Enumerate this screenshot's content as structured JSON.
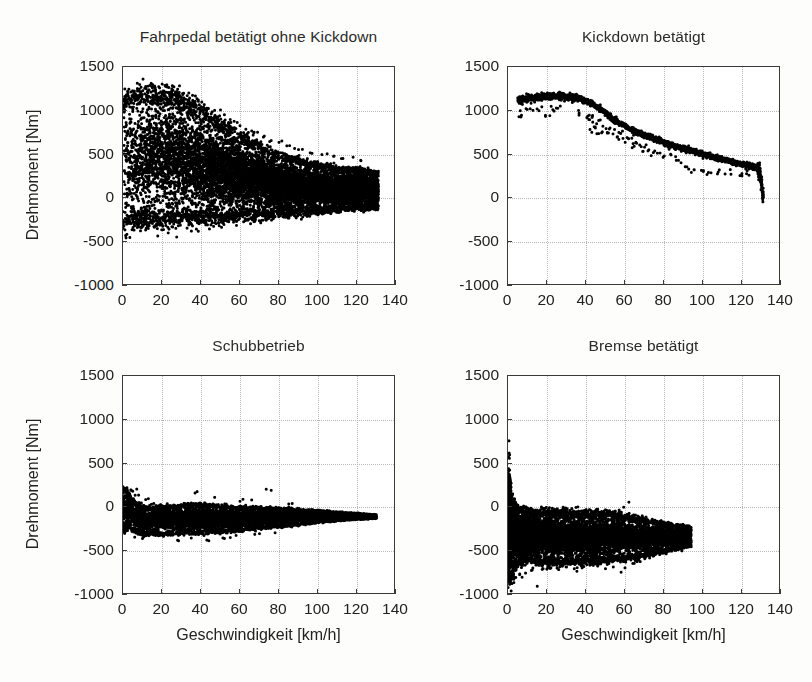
{
  "figure": {
    "width": 812,
    "height": 682,
    "background": "#fdfdfc",
    "marker_color": "#000000",
    "axis_color": "#3a3a3a",
    "grid_color": "#b8b8b8"
  },
  "axis_labels": {
    "x": "Geschwindigkeit [km/h]",
    "y": "Drehmoment [Nm]"
  },
  "ticks": {
    "x_values": [
      0,
      20,
      40,
      60,
      80,
      100,
      120,
      140
    ],
    "x_labels": [
      "0",
      "20",
      "40",
      "60",
      "80",
      "100",
      "120",
      "140"
    ],
    "y_values": [
      -1000,
      -500,
      0,
      500,
      1000,
      1500
    ],
    "y_labels": [
      "-1000",
      "-500",
      "0",
      "500",
      "1000",
      "1500"
    ]
  },
  "chart_data": [
    {
      "id": "fahrpedal",
      "type": "scatter",
      "title": "Fahrpedal betätigt ohne Kickdown",
      "xlabel": "Geschwindigkeit [km/h]",
      "ylabel": "Drehmoment [Nm]",
      "xlim": [
        0,
        140
      ],
      "ylim": [
        -1000,
        1500
      ],
      "grid": true,
      "legend": "none",
      "marker": "dot",
      "n_points": 9000,
      "seed": 1337,
      "position": {
        "left": 122,
        "top": 66,
        "width": 273,
        "height": 219
      },
      "title_top": 28,
      "show_ylabel": true,
      "show_xlabel": false,
      "show_xticklabels": true,
      "description": "Dense wedge cloud: torque from about -250 to 1200 Nm, peak near 1150 at 10-35 km/h, tapering to a band around 0-300 Nm above 100 km/h; small isolated blob near 0 km/h at about -300 Nm.",
      "envelope": [
        {
          "x": 0,
          "ymin": -300,
          "ymax": 1050
        },
        {
          "x": 3,
          "ymin": -250,
          "ymax": 1150
        },
        {
          "x": 10,
          "ymin": -230,
          "ymax": 1180
        },
        {
          "x": 20,
          "ymin": -225,
          "ymax": 1160
        },
        {
          "x": 30,
          "ymin": -220,
          "ymax": 1130
        },
        {
          "x": 40,
          "ymin": -215,
          "ymax": 980
        },
        {
          "x": 50,
          "ymin": -210,
          "ymax": 850
        },
        {
          "x": 60,
          "ymin": -200,
          "ymax": 700
        },
        {
          "x": 70,
          "ymin": -190,
          "ymax": 580
        },
        {
          "x": 80,
          "ymin": -175,
          "ymax": 480
        },
        {
          "x": 90,
          "ymin": -160,
          "ymax": 420
        },
        {
          "x": 100,
          "ymin": -145,
          "ymax": 370
        },
        {
          "x": 110,
          "ymin": -120,
          "ymax": 330
        },
        {
          "x": 120,
          "ymin": -110,
          "ymax": 320
        },
        {
          "x": 128,
          "ymin": -105,
          "ymax": 300
        },
        {
          "x": 131,
          "ymin": -100,
          "ymax": 280
        }
      ],
      "outliers": [
        {
          "x": 4,
          "y": 1215
        },
        {
          "x": 25,
          "y": 1200
        },
        {
          "x": 34,
          "y": 1105
        },
        {
          "x": 43,
          "y": 1030
        },
        {
          "x": 47,
          "y": 1005
        },
        {
          "x": 50,
          "y": 1010
        },
        {
          "x": 52,
          "y": 955
        },
        {
          "x": 55,
          "y": 900
        },
        {
          "x": 57,
          "y": 880
        },
        {
          "x": 60,
          "y": 830
        },
        {
          "x": 63,
          "y": 790
        },
        {
          "x": 66,
          "y": 770
        },
        {
          "x": 69,
          "y": 755
        },
        {
          "x": 72,
          "y": 700
        },
        {
          "x": 76,
          "y": 660
        },
        {
          "x": 80,
          "y": 640
        },
        {
          "x": 84,
          "y": 600
        },
        {
          "x": 88,
          "y": 570
        },
        {
          "x": 92,
          "y": 560
        },
        {
          "x": 96,
          "y": 520
        },
        {
          "x": 102,
          "y": 500
        },
        {
          "x": 108,
          "y": 480
        },
        {
          "x": 112,
          "y": 455
        },
        {
          "x": 118,
          "y": 470
        },
        {
          "x": 122,
          "y": 430
        },
        {
          "x": 1,
          "y": -360
        },
        {
          "x": 2,
          "y": -410
        }
      ]
    },
    {
      "id": "kickdown",
      "type": "scatter",
      "title": "Kickdown betätigt",
      "xlabel": "Geschwindigkeit [km/h]",
      "ylabel": "Drehmoment [Nm]",
      "xlim": [
        0,
        140
      ],
      "ylim": [
        -1000,
        1500
      ],
      "grid": true,
      "legend": "none",
      "marker": "dot",
      "n_points": 2600,
      "seed": 4242,
      "position": {
        "left": 507,
        "top": 66,
        "width": 273,
        "height": 219
      },
      "title_top": 28,
      "show_ylabel": false,
      "show_xlabel": false,
      "show_xticklabels": true,
      "description": "Narrow descending curve: plateau at about 1130-1180 Nm from 5 to 38 km/h, then falling steadily to about 350 Nm at 128 km/h, with a vertical drop to 0 Nm at roughly 130 km/h. A scattered lower branch around 600-950 Nm between 40 and 90 km/h.",
      "curve": [
        {
          "x": 5,
          "y": 1120
        },
        {
          "x": 10,
          "y": 1140
        },
        {
          "x": 15,
          "y": 1150
        },
        {
          "x": 20,
          "y": 1165
        },
        {
          "x": 25,
          "y": 1168
        },
        {
          "x": 30,
          "y": 1160
        },
        {
          "x": 35,
          "y": 1150
        },
        {
          "x": 38,
          "y": 1130
        },
        {
          "x": 42,
          "y": 1090
        },
        {
          "x": 46,
          "y": 1040
        },
        {
          "x": 50,
          "y": 980
        },
        {
          "x": 54,
          "y": 900
        },
        {
          "x": 58,
          "y": 850
        },
        {
          "x": 62,
          "y": 800
        },
        {
          "x": 66,
          "y": 760
        },
        {
          "x": 70,
          "y": 720
        },
        {
          "x": 75,
          "y": 680
        },
        {
          "x": 80,
          "y": 640
        },
        {
          "x": 85,
          "y": 600
        },
        {
          "x": 90,
          "y": 570
        },
        {
          "x": 95,
          "y": 540
        },
        {
          "x": 100,
          "y": 505
        },
        {
          "x": 105,
          "y": 475
        },
        {
          "x": 110,
          "y": 445
        },
        {
          "x": 115,
          "y": 415
        },
        {
          "x": 120,
          "y": 390
        },
        {
          "x": 124,
          "y": 370
        },
        {
          "x": 127,
          "y": 355
        },
        {
          "x": 129,
          "y": 320
        },
        {
          "x": 130,
          "y": 180
        },
        {
          "x": 130.5,
          "y": 40
        },
        {
          "x": 131,
          "y": 0
        }
      ],
      "lower_branch": [
        {
          "x": 40,
          "y": 940
        },
        {
          "x": 42,
          "y": 900
        },
        {
          "x": 44,
          "y": 930
        },
        {
          "x": 45,
          "y": 820
        },
        {
          "x": 47,
          "y": 880
        },
        {
          "x": 48,
          "y": 760
        },
        {
          "x": 50,
          "y": 800
        },
        {
          "x": 52,
          "y": 740
        },
        {
          "x": 54,
          "y": 790
        },
        {
          "x": 56,
          "y": 700
        },
        {
          "x": 58,
          "y": 740
        },
        {
          "x": 60,
          "y": 660
        },
        {
          "x": 62,
          "y": 690
        },
        {
          "x": 64,
          "y": 610
        },
        {
          "x": 66,
          "y": 640
        },
        {
          "x": 68,
          "y": 560
        },
        {
          "x": 70,
          "y": 600
        },
        {
          "x": 73,
          "y": 520
        },
        {
          "x": 76,
          "y": 545
        },
        {
          "x": 80,
          "y": 480
        },
        {
          "x": 84,
          "y": 500
        },
        {
          "x": 88,
          "y": 430
        },
        {
          "x": 92,
          "y": 360
        },
        {
          "x": 96,
          "y": 330
        },
        {
          "x": 100,
          "y": 320
        },
        {
          "x": 104,
          "y": 300
        },
        {
          "x": 108,
          "y": 305
        },
        {
          "x": 114,
          "y": 290
        },
        {
          "x": 120,
          "y": 285
        },
        {
          "x": 123,
          "y": 275
        },
        {
          "x": 8,
          "y": 1040
        },
        {
          "x": 12,
          "y": 1010
        },
        {
          "x": 16,
          "y": 1030
        },
        {
          "x": 22,
          "y": 1020
        },
        {
          "x": 26,
          "y": 1050
        },
        {
          "x": 6,
          "y": 930
        },
        {
          "x": 20,
          "y": 950
        },
        {
          "x": 36,
          "y": 980
        },
        {
          "x": 44,
          "y": 760
        }
      ]
    },
    {
      "id": "schubbetrieb",
      "type": "scatter",
      "title": "Schubbetrieb",
      "xlabel": "Geschwindigkeit [km/h]",
      "ylabel": "Drehmoment [Nm]",
      "xlim": [
        0,
        140
      ],
      "ylim": [
        -1000,
        1500
      ],
      "grid": true,
      "legend": "none",
      "marker": "dot",
      "n_points": 6000,
      "seed": 909,
      "position": {
        "left": 122,
        "top": 375,
        "width": 273,
        "height": 219
      },
      "title_top": 337,
      "show_ylabel": true,
      "show_xlabel": true,
      "show_xticklabels": true,
      "description": "Horizontal band of negative torque: mostly between -300 and -20 Nm, widest around 10-50 km/h, narrowing to about -120 Nm near 120 km/h. A few positive spikes up to +200 Nm near 0, 38, 47 and 76 km/h.",
      "envelope": [
        {
          "x": 0,
          "ymin": -250,
          "ymax": 210
        },
        {
          "x": 3,
          "ymin": -230,
          "ymax": 150
        },
        {
          "x": 6,
          "ymin": -260,
          "ymax": 60
        },
        {
          "x": 10,
          "ymin": -300,
          "ymax": 10
        },
        {
          "x": 20,
          "ymin": -300,
          "ymax": 0
        },
        {
          "x": 30,
          "ymin": -290,
          "ymax": 20
        },
        {
          "x": 40,
          "ymin": -285,
          "ymax": 25
        },
        {
          "x": 50,
          "ymin": -275,
          "ymax": 15
        },
        {
          "x": 60,
          "ymin": -255,
          "ymax": -5
        },
        {
          "x": 70,
          "ymin": -235,
          "ymax": -10
        },
        {
          "x": 80,
          "ymin": -215,
          "ymax": -15
        },
        {
          "x": 90,
          "ymin": -195,
          "ymax": -25
        },
        {
          "x": 100,
          "ymin": -170,
          "ymax": -40
        },
        {
          "x": 110,
          "ymin": -150,
          "ymax": -55
        },
        {
          "x": 120,
          "ymin": -135,
          "ymax": -70
        },
        {
          "x": 130,
          "ymin": -125,
          "ymax": -85
        }
      ],
      "outliers": [
        {
          "x": 2,
          "y": 225
        },
        {
          "x": 4,
          "y": 200
        },
        {
          "x": 5,
          "y": 185
        },
        {
          "x": 8,
          "y": 140
        },
        {
          "x": 13,
          "y": 100
        },
        {
          "x": 38,
          "y": 180
        },
        {
          "x": 47,
          "y": 115
        },
        {
          "x": 60,
          "y": 70
        },
        {
          "x": 66,
          "y": 85
        },
        {
          "x": 76,
          "y": 195
        },
        {
          "x": 85,
          "y": 40
        },
        {
          "x": 6,
          "y": -340
        },
        {
          "x": 10,
          "y": -355
        },
        {
          "x": 28,
          "y": -375
        },
        {
          "x": 35,
          "y": -350
        },
        {
          "x": 44,
          "y": -380
        },
        {
          "x": 52,
          "y": -355
        },
        {
          "x": 58,
          "y": -320
        },
        {
          "x": 70,
          "y": -300
        },
        {
          "x": 78,
          "y": -290
        }
      ]
    },
    {
      "id": "bremse",
      "type": "scatter",
      "title": "Bremse betätigt",
      "xlabel": "Geschwindigkeit [km/h]",
      "ylabel": "Drehmoment [Nm]",
      "xlim": [
        0,
        140
      ],
      "ylim": [
        -1000,
        1500
      ],
      "grid": true,
      "legend": "none",
      "marker": "dot",
      "n_points": 7000,
      "seed": 5150,
      "position": {
        "left": 507,
        "top": 375,
        "width": 273,
        "height": 219
      },
      "title_top": 337,
      "show_ylabel": false,
      "show_xlabel": true,
      "show_xticklabels": true,
      "description": "Fan-shaped negative cloud from 0 to about 95 km/h: a vertical spike at 0 km/h spanning -800 to +750 Nm, a dense core between -600 and -100 Nm across 5-70 km/h, converging to roughly -200 to -450 Nm at 90 km/h. Sparse lower outliers near -700 to -900 Nm below 60 km/h. No data beyond 95 km/h.",
      "envelope": [
        {
          "x": 0,
          "ymin": -820,
          "ymax": 430
        },
        {
          "x": 2,
          "ymin": -780,
          "ymax": 120
        },
        {
          "x": 5,
          "ymin": -620,
          "ymax": -30
        },
        {
          "x": 10,
          "ymin": -600,
          "ymax": -40
        },
        {
          "x": 15,
          "ymin": -610,
          "ymax": -55
        },
        {
          "x": 20,
          "ymin": -625,
          "ymax": -60
        },
        {
          "x": 30,
          "ymin": -620,
          "ymax": -65
        },
        {
          "x": 40,
          "ymin": -610,
          "ymax": -70
        },
        {
          "x": 50,
          "ymin": -600,
          "ymax": -80
        },
        {
          "x": 60,
          "ymin": -580,
          "ymax": -110
        },
        {
          "x": 70,
          "ymin": -540,
          "ymax": -150
        },
        {
          "x": 80,
          "ymin": -500,
          "ymax": -190
        },
        {
          "x": 88,
          "ymin": -460,
          "ymax": -210
        },
        {
          "x": 94,
          "ymin": -430,
          "ymax": -230
        }
      ],
      "spike": {
        "x": 0.6,
        "ymin": -720,
        "ymax": 380,
        "n": 260
      },
      "outliers": [
        {
          "x": 0.5,
          "y": 760
        },
        {
          "x": 0.6,
          "y": 620
        },
        {
          "x": 0.7,
          "y": 560
        },
        {
          "x": 0.8,
          "y": 600
        },
        {
          "x": 62,
          "y": 60
        },
        {
          "x": 46,
          "y": -20
        },
        {
          "x": 57,
          "y": -30
        },
        {
          "x": 2,
          "y": -870
        },
        {
          "x": 3,
          "y": -820
        },
        {
          "x": 4,
          "y": -800
        },
        {
          "x": 6,
          "y": -760
        },
        {
          "x": 9,
          "y": -750
        },
        {
          "x": 12,
          "y": -720
        },
        {
          "x": 15,
          "y": -900
        },
        {
          "x": 18,
          "y": -700
        },
        {
          "x": 22,
          "y": -690
        },
        {
          "x": 26,
          "y": -710
        },
        {
          "x": 30,
          "y": -680
        },
        {
          "x": 34,
          "y": -700
        },
        {
          "x": 38,
          "y": -690
        },
        {
          "x": 42,
          "y": -660
        },
        {
          "x": 46,
          "y": -670
        },
        {
          "x": 50,
          "y": -700
        },
        {
          "x": 54,
          "y": -680
        },
        {
          "x": 58,
          "y": -740
        },
        {
          "x": 60,
          "y": -690
        },
        {
          "x": 64,
          "y": -640
        },
        {
          "x": 3,
          "y": -540
        },
        {
          "x": 5,
          "y": -560
        },
        {
          "x": 8,
          "y": -520
        }
      ]
    }
  ]
}
